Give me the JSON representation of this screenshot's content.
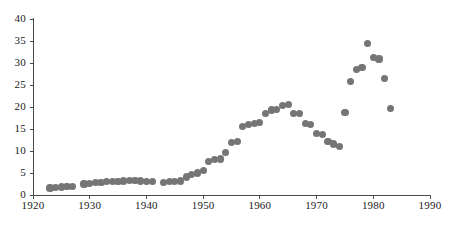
{
  "chart_data": {
    "type": "scatter",
    "title": "",
    "subtitle": "",
    "xlabel": "",
    "ylabel": "",
    "xlim": [
      1920,
      1990
    ],
    "ylim": [
      0,
      40
    ],
    "grid": false,
    "legend": null,
    "xticks": [
      1920,
      1930,
      1940,
      1950,
      1960,
      1970,
      1980,
      1990
    ],
    "yticks": [
      0,
      5,
      10,
      15,
      20,
      25,
      30,
      35,
      40
    ],
    "marker_color": "#757575",
    "axis_color": "#4a4a4a",
    "series": [
      {
        "name": "series-1",
        "points": [
          [
            1923,
            1.6
          ],
          [
            1924,
            1.7
          ],
          [
            1925,
            1.8
          ],
          [
            1926,
            1.9
          ],
          [
            1927,
            2.0
          ],
          [
            1929,
            2.5
          ],
          [
            1930,
            2.7
          ],
          [
            1931,
            2.8
          ],
          [
            1932,
            2.9
          ],
          [
            1933,
            3.0
          ],
          [
            1934,
            3.0
          ],
          [
            1935,
            3.1
          ],
          [
            1936,
            3.2
          ],
          [
            1937,
            3.3
          ],
          [
            1938,
            3.3
          ],
          [
            1939,
            3.2
          ],
          [
            1940,
            3.1
          ],
          [
            1941,
            3.0
          ],
          [
            1943,
            2.9
          ],
          [
            1944,
            3.0
          ],
          [
            1945,
            3.1
          ],
          [
            1946,
            3.2
          ],
          [
            1947,
            4.1
          ],
          [
            1948,
            4.6
          ],
          [
            1949,
            5.0
          ],
          [
            1950,
            5.6
          ],
          [
            1951,
            7.6
          ],
          [
            1952,
            8.0
          ],
          [
            1953,
            8.2
          ],
          [
            1954,
            9.6
          ],
          [
            1955,
            11.9
          ],
          [
            1956,
            12.2
          ],
          [
            1957,
            15.6
          ],
          [
            1958,
            16.0
          ],
          [
            1959,
            16.2
          ],
          [
            1960,
            16.4
          ],
          [
            1961,
            18.6
          ],
          [
            1962,
            19.3
          ],
          [
            1963,
            19.5
          ],
          [
            1964,
            20.3
          ],
          [
            1965,
            20.5
          ],
          [
            1966,
            18.5
          ],
          [
            1967,
            18.6
          ],
          [
            1968,
            16.3
          ],
          [
            1969,
            16.1
          ],
          [
            1970,
            14.0
          ],
          [
            1971,
            13.7
          ],
          [
            1972,
            12.2
          ],
          [
            1973,
            11.6
          ],
          [
            1974,
            11.0
          ],
          [
            1975,
            18.7
          ],
          [
            1976,
            25.8
          ],
          [
            1977,
            28.6
          ],
          [
            1978,
            29.0
          ],
          [
            1979,
            34.4
          ],
          [
            1980,
            31.3
          ],
          [
            1981,
            30.9
          ],
          [
            1982,
            26.4
          ],
          [
            1983,
            19.7
          ]
        ]
      }
    ]
  }
}
